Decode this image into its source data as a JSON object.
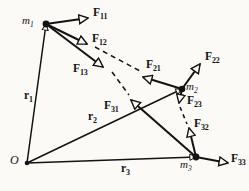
{
  "figure": {
    "background_color": "#fbfaf7",
    "stroke_color": "#131313",
    "width": 249,
    "height": 191
  },
  "origin": {
    "label": "O",
    "x": 27,
    "y": 163
  },
  "particles": [
    {
      "id": "m1",
      "label": "m",
      "sub": "1",
      "x": 46,
      "y": 24,
      "label_x": 22,
      "label_y": 16
    },
    {
      "id": "m2",
      "label": "m",
      "sub": "2",
      "x": 182,
      "y": 89,
      "label_x": 186,
      "label_y": 82
    },
    {
      "id": "m3",
      "label": "m",
      "sub": "3",
      "x": 196,
      "y": 157,
      "label_x": 181,
      "label_y": 160
    }
  ],
  "position_vectors": [
    {
      "id": "r1",
      "label": "r",
      "sub": "1",
      "from_x": 27,
      "from_y": 163,
      "to_x": 46,
      "to_y": 24,
      "label_x": 26,
      "label_y": 96,
      "style": "solid"
    },
    {
      "id": "r2",
      "label": "r",
      "sub": "2",
      "from_x": 27,
      "from_y": 163,
      "to_x": 182,
      "to_y": 89,
      "label_x": 92,
      "label_y": 117,
      "style": "solid"
    },
    {
      "id": "r3",
      "label": "r",
      "sub": "3",
      "from_x": 27,
      "from_y": 163,
      "to_x": 196,
      "to_y": 157,
      "label_x": 123,
      "label_y": 168,
      "style": "solid"
    }
  ],
  "forces": [
    {
      "id": "F11",
      "label": "F",
      "sub": "11",
      "from_x": 46,
      "from_y": 24,
      "to_x": 88,
      "to_y": 18,
      "label_x": 94,
      "label_y": 10,
      "style": "solid",
      "on": "m1"
    },
    {
      "id": "F12",
      "label": "F",
      "sub": "12",
      "from_x": 46,
      "from_y": 24,
      "to_x": 87,
      "to_y": 44,
      "label_x": 93,
      "label_y": 36,
      "style": "solid",
      "on": "m1"
    },
    {
      "id": "F13",
      "label": "F",
      "sub": "13",
      "from_x": 46,
      "from_y": 24,
      "to_x": 103,
      "to_y": 67,
      "label_x": 76,
      "label_y": 68,
      "style": "solid",
      "on": "m1"
    },
    {
      "id": "F21",
      "label": "F",
      "sub": "21",
      "from_x": 182,
      "from_y": 89,
      "to_x": 142,
      "to_y": 77,
      "label_x": 147,
      "label_y": 63,
      "style": "dashed",
      "on": "m2"
    },
    {
      "id": "F22",
      "label": "F",
      "sub": "22",
      "from_x": 182,
      "from_y": 89,
      "to_x": 200,
      "to_y": 64,
      "label_x": 206,
      "label_y": 55,
      "style": "solid",
      "on": "m2"
    },
    {
      "id": "F23",
      "label": "F",
      "sub": "23",
      "from_x": 182,
      "from_y": 89,
      "to_x": 179,
      "to_y": 103,
      "label_x": 187,
      "label_y": 99,
      "style": "solid",
      "on": "m2"
    },
    {
      "id": "F31",
      "label": "F",
      "sub": "31",
      "from_x": 196,
      "from_y": 157,
      "to_x": 131,
      "to_y": 100,
      "label_x": 106,
      "label_y": 104,
      "style": "dashed",
      "on": "m3"
    },
    {
      "id": "F32",
      "label": "F",
      "sub": "32",
      "from_x": 196,
      "from_y": 157,
      "to_x": 188,
      "to_y": 126,
      "label_x": 195,
      "label_y": 121,
      "style": "dashed",
      "on": "m3"
    },
    {
      "id": "F33",
      "label": "F",
      "sub": "33",
      "from_x": 196,
      "from_y": 157,
      "to_x": 228,
      "to_y": 163,
      "label_x": 232,
      "label_y": 157,
      "style": "solid",
      "on": "m3"
    }
  ],
  "dashed_extensions": [
    {
      "id": "F12-to-F21",
      "from_x": 95,
      "from_y": 47,
      "to_x": 140,
      "to_y": 71
    },
    {
      "id": "F13-to-F31",
      "from_x": 112,
      "from_y": 72,
      "to_x": 129,
      "to_y": 95
    }
  ]
}
